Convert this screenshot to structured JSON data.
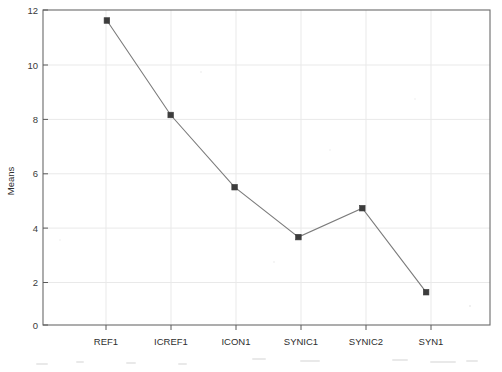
{
  "chart_data": {
    "type": "line",
    "title": "",
    "xlabel": "",
    "ylabel": "Means",
    "categories": [
      "REF1",
      "ICREF1",
      "ICON1",
      "SYNIC1",
      "SYNIC2",
      "SYN1"
    ],
    "values": [
      11.6,
      8.0,
      5.25,
      3.35,
      4.45,
      1.25
    ],
    "series": [
      {
        "name": "Means",
        "values": [
          11.6,
          8.0,
          5.25,
          3.35,
          4.45,
          1.25
        ]
      }
    ],
    "ylim": [
      0,
      12
    ],
    "yticks": [
      0,
      2,
      4,
      6,
      8,
      10,
      12
    ],
    "ytick_labels": [
      "0",
      "2",
      "4",
      "6",
      "8",
      "10",
      "12"
    ],
    "grid": "horizontal-and-vertical",
    "legend": "none",
    "marker": "filled-square",
    "line_color": "#7b7b7b",
    "marker_color": "#3c3c3c",
    "grid_color": "#e9e9e9",
    "frame_color": "#6a6a6a",
    "background_color": "#ffffff"
  },
  "axes": {
    "y_title": "Means",
    "y_tick_labels": [
      "12",
      "10",
      "8",
      "6",
      "4",
      "2",
      "0"
    ],
    "x_tick_labels": [
      "REF1",
      "ICREF1",
      "ICON1",
      "SYNIC1",
      "SYNIC2",
      "SYN1"
    ]
  },
  "points": [
    {
      "label": "REF1",
      "value": "11.6"
    },
    {
      "label": "ICREF1",
      "value": "8.0"
    },
    {
      "label": "ICON1",
      "value": "5.25"
    },
    {
      "label": "SYNIC1",
      "value": "3.35"
    },
    {
      "label": "SYNIC2",
      "value": "4.45"
    },
    {
      "label": "SYN1",
      "value": "1.25"
    }
  ]
}
